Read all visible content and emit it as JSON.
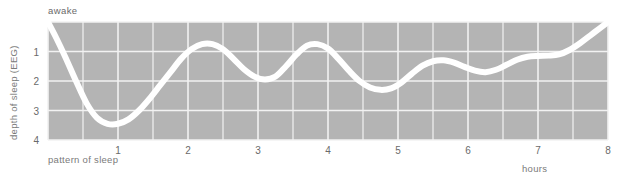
{
  "figure": {
    "plot": {
      "bg_color": "#b4b4b4",
      "grid_color": "#f2f2f2",
      "curve_color": "#ffffff",
      "text_color": "#6f6f6f",
      "x_left_px": 48,
      "x_right_px": 608,
      "y_top_px": 22,
      "y_bottom_px": 140
    },
    "axis": {
      "ylabel": "depth of sleep (EEG)",
      "xlabel_left": "pattern of sleep",
      "xlabel_right": "hours",
      "awake_label": "awake"
    }
  },
  "chart_data": {
    "type": "line",
    "title": "",
    "subtitle": "",
    "xlabel": "hours",
    "ylabel": "depth of sleep (EEG)",
    "xlim": [
      0,
      8
    ],
    "ylim": [
      0,
      4
    ],
    "y_inverted": true,
    "grid": true,
    "legend": null,
    "annotations": [
      {
        "text": "awake",
        "x": 0.0,
        "y": 0.0,
        "position": "top-left-outside"
      },
      {
        "text": "pattern of sleep",
        "x": 0.1,
        "y": 4.0,
        "position": "bottom-left-outside"
      },
      {
        "text": "hours",
        "x": 7.4,
        "y": 4.0,
        "position": "bottom-right-outside"
      }
    ],
    "xticks": [
      1,
      2,
      3,
      4,
      5,
      6,
      7,
      8
    ],
    "xticklabels": [
      "1",
      "2",
      "3",
      "4",
      "5",
      "6",
      "7",
      "8"
    ],
    "x_minor_gridline_step": 0.5,
    "yticks": [
      0,
      1,
      2,
      3,
      4
    ],
    "yticklabels": [
      "awake",
      "1",
      "2",
      "3",
      "4"
    ],
    "series": [
      {
        "name": "depth of sleep",
        "linewidth_px": 6,
        "color": "#ffffff",
        "x": [
          0.0,
          0.12,
          0.25,
          0.4,
          0.55,
          0.7,
          0.85,
          1.0,
          1.15,
          1.3,
          1.45,
          1.6,
          1.75,
          1.9,
          2.05,
          2.2,
          2.35,
          2.5,
          2.65,
          2.8,
          2.95,
          3.1,
          3.25,
          3.4,
          3.55,
          3.7,
          3.85,
          4.0,
          4.15,
          4.3,
          4.45,
          4.6,
          4.75,
          4.9,
          5.05,
          5.2,
          5.35,
          5.5,
          5.65,
          5.8,
          5.95,
          6.1,
          6.25,
          6.4,
          6.55,
          6.7,
          6.85,
          7.0,
          7.15,
          7.3,
          7.45,
          7.6,
          7.75,
          7.9,
          8.0
        ],
        "y": [
          0.0,
          0.55,
          1.2,
          2.0,
          2.75,
          3.25,
          3.45,
          3.45,
          3.3,
          3.0,
          2.6,
          2.15,
          1.7,
          1.25,
          0.92,
          0.75,
          0.75,
          0.92,
          1.25,
          1.6,
          1.85,
          1.95,
          1.85,
          1.5,
          1.1,
          0.8,
          0.75,
          0.9,
          1.25,
          1.65,
          2.0,
          2.22,
          2.3,
          2.25,
          2.05,
          1.75,
          1.48,
          1.33,
          1.3,
          1.38,
          1.52,
          1.65,
          1.7,
          1.62,
          1.45,
          1.28,
          1.18,
          1.15,
          1.14,
          1.1,
          0.95,
          0.72,
          0.45,
          0.18,
          0.0
        ]
      }
    ]
  }
}
